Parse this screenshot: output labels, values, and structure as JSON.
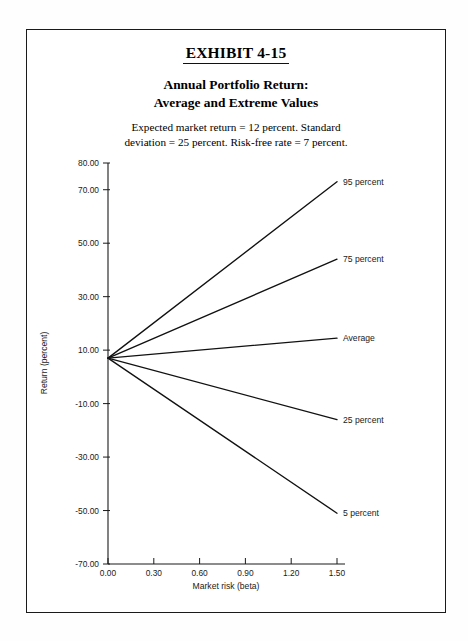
{
  "exhibit": {
    "number_label": "EXHIBIT 4-15",
    "title_line_1": "Annual Portfolio Return:",
    "title_line_2": "Average and Extreme Values",
    "subtitle_line_1": "Expected market return = 12 percent. Standard",
    "subtitle_line_2": "deviation = 25 percent. Risk-free rate = 7 percent."
  },
  "chart_data": {
    "type": "line",
    "title": "Annual Portfolio Return: Average and Extreme Values",
    "subtitle": "Expected market return = 12 percent. Standard deviation = 25 percent. Risk-free rate = 7 percent.",
    "xlabel": "Market risk (beta)",
    "ylabel": "Return (percent)",
    "xlim": [
      0.0,
      1.5
    ],
    "ylim": [
      -70.0,
      80.0
    ],
    "grid": false,
    "legend_position": "right-inline-labels",
    "x_ticks": [
      0.0,
      0.3,
      0.6,
      0.9,
      1.2,
      1.5
    ],
    "x_tick_labels": [
      "0.00",
      "0.30",
      "0.60",
      "0.90",
      "1.20",
      "1.50"
    ],
    "y_ticks": [
      80.0,
      70.0,
      50.0,
      30.0,
      10.0,
      -10.0,
      -30.0,
      -50.0,
      -70.0
    ],
    "y_tick_labels": [
      "80.00",
      "70.00",
      "50.00",
      "30.00",
      "10.00",
      "-10.00",
      "-30.00",
      "-50.00",
      "-70.00"
    ],
    "origin_point": {
      "x": 0.0,
      "y": 7.0,
      "note": "risk-free rate"
    },
    "x": [
      0.0,
      1.5
    ],
    "series": [
      {
        "name": "95 percent",
        "label": "95 percent",
        "values": [
          7.0,
          73.0
        ]
      },
      {
        "name": "75 percent",
        "label": "75 percent",
        "values": [
          7.0,
          44.0
        ]
      },
      {
        "name": "Average",
        "label": "Average",
        "values": [
          7.0,
          14.5
        ]
      },
      {
        "name": "25 percent",
        "label": "25 percent",
        "values": [
          7.0,
          -16.0
        ]
      },
      {
        "name": "5 percent",
        "label": "5 percent",
        "values": [
          7.0,
          -51.0
        ]
      }
    ]
  },
  "colors": {
    "line": "#111111",
    "axis": "#1a1a1a",
    "frame": "#1a1a1a",
    "background": "#ffffff"
  }
}
